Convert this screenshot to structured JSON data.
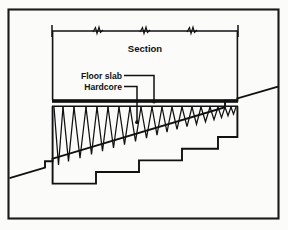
{
  "figure": {
    "caption_title": "Section",
    "labels": [
      {
        "id": "floor-slab",
        "text": "Floor slab"
      },
      {
        "id": "hardcore",
        "text": "Hardcore"
      }
    ],
    "colors": {
      "ink": "#111111",
      "paper": "#fbfbf9",
      "border": "#1a1a1a",
      "slab_fill": "#111111"
    },
    "geometry": {
      "border": {
        "x": 8,
        "y": 9,
        "width": 271,
        "height": 210
      },
      "dimension_line": {
        "y": 31,
        "x_left": 52,
        "x_right": 238,
        "tick_height": 10
      },
      "break_marks_x": [
        98,
        145,
        192
      ],
      "slab": {
        "x_left": 52,
        "x_right": 238,
        "y_top": 99,
        "thickness": 3.4
      },
      "slab_underline_y": 106,
      "ground_line": {
        "x_start": 8,
        "y_start": 178,
        "x_end": 279,
        "y_end": 98
      },
      "zigzag_count": 15,
      "steps": 5
    },
    "annotations": {
      "floor_slab_leader": {
        "text_end_x": 122,
        "text_y": 78,
        "elbow_x": 154,
        "tip_x": 154,
        "tip_y": 103
      },
      "hardcore_leader": {
        "text_end_x": 122,
        "text_y": 89,
        "elbow_x": 137,
        "tip_x": 137,
        "tip_y": 123
      }
    }
  }
}
